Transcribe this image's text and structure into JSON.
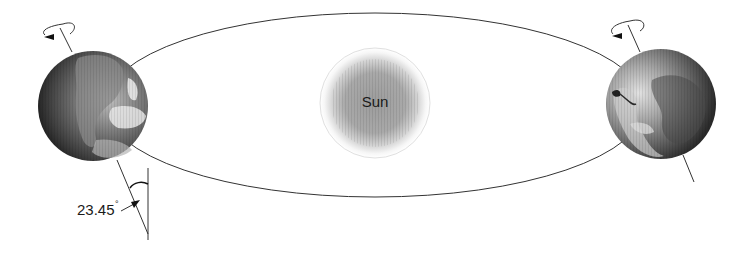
{
  "diagram": {
    "type": "earth-orbit",
    "sun": {
      "label": "Sun",
      "center": [
        375,
        103
      ],
      "radius": 55
    },
    "orbit": {
      "center": [
        375,
        105
      ],
      "rx": 270,
      "ry": 92
    },
    "earths": [
      {
        "position": "left",
        "center": [
          93,
          106
        ],
        "radius": 55,
        "axis_tilt_deg": 23.45
      },
      {
        "position": "right",
        "center": [
          661,
          104
        ],
        "radius": 55,
        "axis_tilt_deg": 23.45
      }
    ],
    "angle_annotation": {
      "value": "23.45",
      "unit_symbol": "°"
    },
    "colors": {
      "line": "#333333",
      "sun_core": "#9a9a9a",
      "earth_dark": "#2e2e2e",
      "earth_light": "#d8d8d8"
    }
  }
}
